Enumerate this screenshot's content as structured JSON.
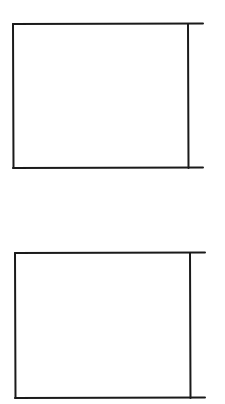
{
  "canvas": {
    "width": 225,
    "height": 404,
    "background": "#ffffff"
  },
  "stroke": {
    "color": "#1a1a1a",
    "width": 2
  },
  "shapes": [
    {
      "name": "bracket-box-top",
      "left": 13,
      "top": 24,
      "right_bar_x": 188,
      "bottom": 168,
      "extension_x": 203
    },
    {
      "name": "bracket-box-bottom",
      "left": 15,
      "top": 253,
      "right_bar_x": 190,
      "bottom": 398,
      "extension_x": 205
    }
  ]
}
